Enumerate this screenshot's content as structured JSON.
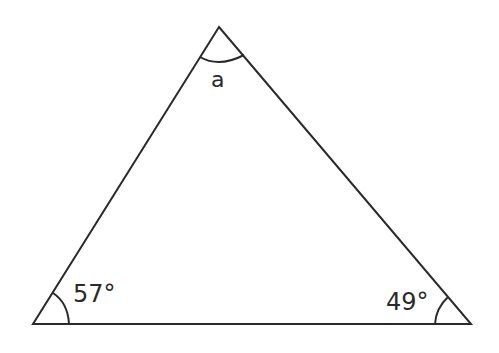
{
  "diagram": {
    "type": "triangle",
    "angles": {
      "top": {
        "label": "a"
      },
      "bottom_left": {
        "label": "57°"
      },
      "bottom_right": {
        "label": "49°"
      }
    },
    "line_color": "#2a2a2a"
  }
}
